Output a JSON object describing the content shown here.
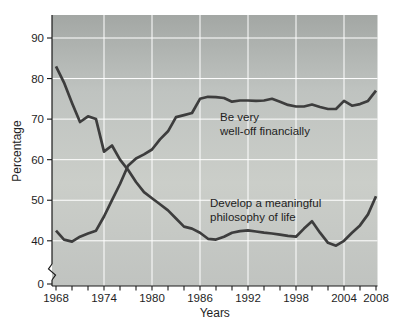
{
  "figure": {
    "background": "#ffffff",
    "text_color": "#1e1e1e",
    "axis_color": "#1a1a1a"
  },
  "chart_data": {
    "type": "line",
    "title": "",
    "xlabel": "Years",
    "ylabel": "Percentage",
    "x_range": [
      1968,
      2008
    ],
    "y_range_shown": [
      40,
      90
    ],
    "y_axis_break": true,
    "y_break_label": "0",
    "grid": true,
    "legend": "inline-annotations",
    "gridline_color": "#ffffff",
    "line_color": "#3d3d3d",
    "plot_bg_gradient": [
      "#a3a7a4",
      "#bfc3c0",
      "#cbcec9",
      "#c0c3c0"
    ],
    "yticks": [
      40,
      50,
      60,
      70,
      80,
      90
    ],
    "xticks_labeled": [
      1968,
      1974,
      1980,
      1986,
      1992,
      1998,
      2004,
      2008
    ],
    "xticks_minor_step": 2,
    "x": [
      1968,
      1969,
      1970,
      1971,
      1972,
      1973,
      1974,
      1975,
      1976,
      1977,
      1978,
      1979,
      1980,
      1981,
      1982,
      1983,
      1984,
      1985,
      1986,
      1987,
      1988,
      1989,
      1990,
      1991,
      1992,
      1993,
      1994,
      1995,
      1996,
      1997,
      1998,
      1999,
      2000,
      2001,
      2002,
      2003,
      2004,
      2005,
      2006,
      2007,
      2008
    ],
    "series": [
      {
        "name": "Be very well-off financially",
        "label_lines": [
          "Be very",
          "well-off financially"
        ],
        "values": [
          42.5,
          40.3,
          39.8,
          41,
          41.8,
          42.5,
          46,
          50,
          54,
          58.5,
          60.3,
          61.3,
          62.5,
          65,
          67,
          70.5,
          71,
          71.5,
          75,
          75.5,
          75.4,
          75.2,
          74.3,
          74.6,
          74.6,
          74.5,
          74.6,
          75,
          74.3,
          73.5,
          73.1,
          73.1,
          73.6,
          73,
          72.5,
          72.5,
          74.5,
          73.3,
          73.7,
          74.5,
          77
        ]
      },
      {
        "name": "Develop a meaningful philosophy of life",
        "label_lines": [
          "Develop a meaningful",
          "philosophy of life"
        ],
        "values": [
          83,
          79,
          74,
          69.3,
          70.7,
          70,
          62,
          63.5,
          60,
          57.5,
          54.5,
          52,
          50.5,
          49,
          47.5,
          45.5,
          43.5,
          43,
          42,
          40.5,
          40.3,
          41,
          42,
          42.4,
          42.6,
          42.3,
          42,
          41.8,
          41.5,
          41.2,
          41,
          43,
          44.8,
          42,
          39.5,
          38.8,
          40,
          42,
          43.8,
          46.5,
          51
        ]
      }
    ]
  }
}
